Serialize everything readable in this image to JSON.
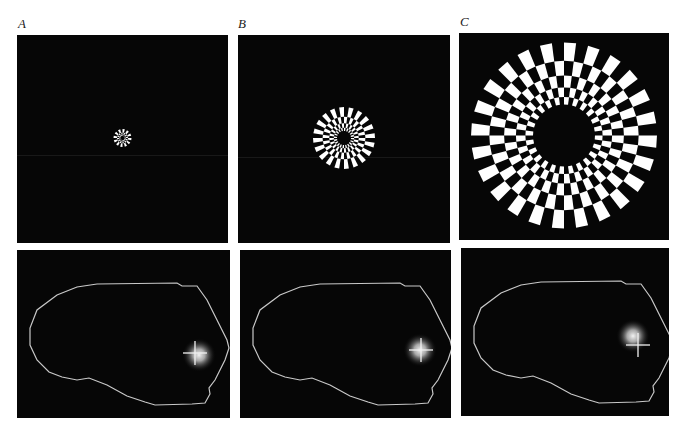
{
  "figure": {
    "columns": [
      {
        "label": "A",
        "stimulus": {
          "description": "small checkerboard ring stimulus",
          "outer_radius_px": 9,
          "inner_radius_px": 2,
          "rings": 3,
          "sectors": 24
        },
        "activation": {
          "description": "activation spot with crosshair, near occipital pole",
          "spot_x": 182,
          "spot_y": 105,
          "cross_x": 178,
          "cross_y": 103
        }
      },
      {
        "label": "B",
        "stimulus": {
          "description": "medium checkerboard ring stimulus",
          "outer_radius_px": 31,
          "inner_radius_px": 7,
          "rings": 4,
          "sectors": 40
        },
        "activation": {
          "description": "activation spot with crosshair, slightly anterior",
          "spot_x": 180,
          "spot_y": 100,
          "cross_x": 181,
          "cross_y": 100
        }
      },
      {
        "label": "C",
        "stimulus": {
          "description": "large annular checkerboard stimulus",
          "outer_radius_px": 93,
          "inner_radius_px": 31,
          "rings": 5,
          "sectors": 48
        },
        "activation": {
          "description": "activation spot with crosshair, further anterior/superior",
          "spot_x": 172,
          "spot_y": 88,
          "cross_x": 177,
          "cross_y": 97
        }
      }
    ],
    "colors": {
      "background": "#ffffff",
      "panel": "#060606",
      "check": "#ffffff",
      "outline": "#c8c8c8",
      "crosshair": "#f2f2f2",
      "label": "#222222"
    }
  }
}
